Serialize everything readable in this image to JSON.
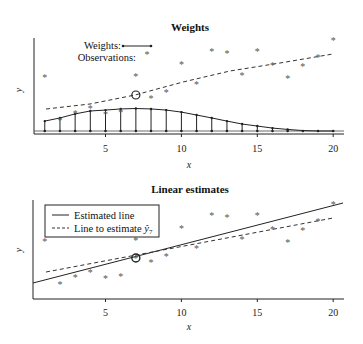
{
  "chart_data": [
    {
      "type": "line",
      "title": "Weights",
      "xlabel": "x",
      "ylabel": "y",
      "xlim": [
        0.2,
        20.7
      ],
      "xticks": [
        5,
        10,
        15,
        20
      ],
      "grid": false,
      "legend": {
        "position": "upper-left",
        "entries": [
          {
            "label": "Weights:",
            "marker": "line-with-dots"
          },
          {
            "label": "Observations:",
            "marker": "asterisk"
          }
        ]
      },
      "observations": {
        "x": [
          1,
          2,
          3,
          4,
          5,
          6,
          7,
          8,
          9,
          10,
          11,
          12,
          13,
          14,
          15,
          16,
          17,
          18,
          19,
          20
        ],
        "y_px": [
          77,
          120,
          113,
          108,
          114,
          112,
          76,
          98,
          92,
          64,
          84,
          51,
          53,
          75,
          51,
          65,
          78,
          66,
          57,
          40
        ]
      },
      "highlight_point": {
        "x": 7,
        "y_px": 95,
        "marker": "circle"
      },
      "smooth_curve_dashed": {
        "x_px": [
          46,
          90,
          135,
          183,
          230,
          280,
          333
        ],
        "y_px": [
          109,
          104,
          95,
          82,
          71,
          63,
          54
        ]
      },
      "weights": {
        "x": [
          1,
          2,
          3,
          4,
          5,
          6,
          7,
          8,
          9,
          10,
          11,
          12,
          13,
          14,
          15,
          16,
          17,
          18,
          19,
          20
        ],
        "values": [
          0.44,
          0.58,
          0.76,
          0.89,
          0.93,
          0.98,
          1.0,
          0.98,
          0.93,
          0.84,
          0.71,
          0.58,
          0.44,
          0.31,
          0.22,
          0.13,
          0.07,
          0.02,
          0.0,
          0.0
        ]
      }
    },
    {
      "type": "line",
      "title": "Linear estimates",
      "xlabel": "x",
      "ylabel": "y",
      "xlim": [
        0.2,
        20.7
      ],
      "xticks": [
        5,
        10,
        15,
        20
      ],
      "grid": false,
      "legend": {
        "position": "upper-left",
        "boxed": true,
        "entries": [
          {
            "label": "Estimated line",
            "style": "solid"
          },
          {
            "label": "Line to estimate ŷ",
            "subscript": "7",
            "style": "dashed"
          }
        ]
      },
      "observations": {
        "x": [
          1,
          2,
          3,
          4,
          5,
          6,
          7,
          8,
          9,
          10,
          11,
          12,
          13,
          14,
          15,
          16,
          17,
          18,
          19,
          20
        ],
        "y_px": [
          241,
          284,
          277,
          272,
          278,
          276,
          240,
          262,
          256,
          228,
          248,
          215,
          217,
          239,
          215,
          229,
          242,
          230,
          221,
          204
        ]
      },
      "highlight_point": {
        "x": 7,
        "y_px": 258,
        "marker": "circle"
      },
      "estimated_line": {
        "x1_px": 33,
        "y1_px": 283,
        "x2_px": 343,
        "y2_px": 203
      },
      "estimate_line_dashed": {
        "x1_px": 46,
        "y1_px": 272,
        "x2_px": 333,
        "y2_px": 218
      }
    }
  ],
  "labels": {
    "top_title": "Weights",
    "bottom_title": "Linear estimates",
    "x_label": "x",
    "y_label": "y",
    "ticks": [
      "5",
      "10",
      "15",
      "20"
    ],
    "legend_weights": "Weights:",
    "legend_observations": "Observations:",
    "legend_estimated": "Estimated line",
    "legend_estimate_to": "Line to estimate ",
    "legend_yhat": "ŷ",
    "legend_sub": "7"
  }
}
